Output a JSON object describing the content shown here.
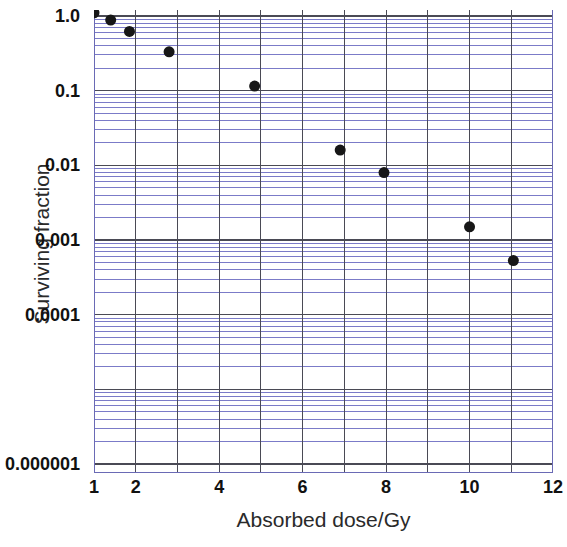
{
  "chart_data": {
    "type": "scatter",
    "title": "",
    "xlabel": "Absorbed dose/Gy",
    "ylabel": "Surviving fraction",
    "xscale": "linear",
    "yscale": "log",
    "xlim": [
      1,
      12
    ],
    "ylim": [
      5e-07,
      1.2
    ],
    "xticks": [
      1,
      2,
      4,
      6,
      8,
      10,
      12
    ],
    "xticklabels": [
      "1",
      "2",
      "4",
      "6",
      "8",
      "10",
      "12"
    ],
    "yticks": [
      1.0,
      0.1,
      0.01,
      0.001,
      0.0001,
      1e-06
    ],
    "yticklabels": [
      "1.0",
      "0.1",
      "0.01",
      "0.001",
      "0.0001",
      "0.000001"
    ],
    "grid": true,
    "grid_minor": true,
    "grid_color": "#7b7bc8",
    "grid_major_color": "#4a4a55",
    "legend": null,
    "marker": "filled-circle",
    "marker_color": "#171717",
    "marker_size": 11,
    "x": [
      1.0,
      1.4,
      1.85,
      2.8,
      4.85,
      6.9,
      7.95,
      10.0,
      11.05
    ],
    "y": [
      1.1,
      0.88,
      0.62,
      0.33,
      0.115,
      0.016,
      0.008,
      0.0015,
      0.00053
    ],
    "points": [
      {
        "x": 1.0,
        "y": 1.1
      },
      {
        "x": 1.4,
        "y": 0.88
      },
      {
        "x": 1.85,
        "y": 0.62
      },
      {
        "x": 2.8,
        "y": 0.33
      },
      {
        "x": 4.85,
        "y": 0.115
      },
      {
        "x": 6.9,
        "y": 0.016
      },
      {
        "x": 7.95,
        "y": 0.008
      },
      {
        "x": 10.0,
        "y": 0.0015
      },
      {
        "x": 11.05,
        "y": 0.00053
      }
    ]
  },
  "axes": {
    "x_title": "Absorbed dose/Gy",
    "y_title": "Surviving fraction"
  }
}
